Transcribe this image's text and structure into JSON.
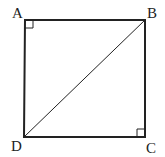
{
  "diagram": {
    "type": "square-with-diagonal",
    "vertices": [
      {
        "label": "A",
        "x": 25,
        "y": 20
      },
      {
        "label": "B",
        "x": 145,
        "y": 20
      },
      {
        "label": "C",
        "x": 145,
        "y": 137
      },
      {
        "label": "D",
        "x": 24,
        "y": 137
      }
    ],
    "diagonal": [
      "D",
      "B"
    ],
    "right_angle_marks": [
      "A",
      "C"
    ],
    "stroke_color": "#222222"
  }
}
